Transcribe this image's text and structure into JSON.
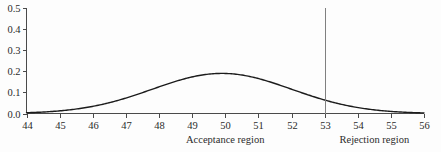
{
  "chart_data": {
    "type": "line",
    "title": "",
    "subtitle": "",
    "xlabel": "",
    "ylabel": "",
    "xlim": [
      44,
      56
    ],
    "ylim": [
      0.0,
      0.5
    ],
    "grid": false,
    "legend": null,
    "x_ticks": [
      "44",
      "45",
      "46",
      "47",
      "48",
      "49",
      "50",
      "51",
      "52",
      "53",
      "54",
      "55",
      "56"
    ],
    "x_tick_values": [
      44,
      45,
      46,
      47,
      48,
      49,
      50,
      51,
      52,
      53,
      54,
      55,
      56
    ],
    "y_ticks": [
      "0.0",
      "0.1",
      "0.2",
      "0.3",
      "0.4",
      "0.5"
    ],
    "y_tick_values": [
      0.0,
      0.1,
      0.2,
      0.3,
      0.4,
      0.5
    ],
    "series": [
      {
        "name": "normal-density",
        "type": "line",
        "distribution": "normal",
        "mean": 49.9,
        "std_dev": 2.1,
        "peak_value": 0.19,
        "peak_x": 49.9,
        "color": "#1c1c1c",
        "x": [
          44.0,
          44.5,
          45.0,
          45.5,
          46.0,
          46.5,
          47.0,
          47.5,
          48.0,
          48.5,
          49.0,
          49.5,
          50.0,
          50.5,
          51.0,
          51.5,
          52.0,
          52.5,
          53.0,
          53.5,
          54.0,
          54.5,
          55.0,
          55.5,
          56.0
        ],
        "values": [
          0.004,
          0.008,
          0.014,
          0.024,
          0.038,
          0.056,
          0.079,
          0.105,
          0.132,
          0.157,
          0.177,
          0.189,
          0.19,
          0.183,
          0.167,
          0.145,
          0.12,
          0.094,
          0.07,
          0.049,
          0.033,
          0.021,
          0.012,
          0.007,
          0.004
        ]
      }
    ],
    "annotations": [
      {
        "name": "critical-value-line",
        "type": "vline",
        "x": 53,
        "y_from": 0.0,
        "y_to": 0.5,
        "color": "#808080"
      }
    ],
    "region_labels": [
      {
        "name": "acceptance-region",
        "text": "Acceptance region",
        "x_center": 50.0
      },
      {
        "name": "rejection-region",
        "text": "Rejection region",
        "x_center": 54.5
      }
    ]
  },
  "colors": {
    "background": "#fdfdfd",
    "curve": "#1c1c1c",
    "axis": "#4a4a4a",
    "critical_line": "#808080",
    "text": "#2b2b2b"
  }
}
